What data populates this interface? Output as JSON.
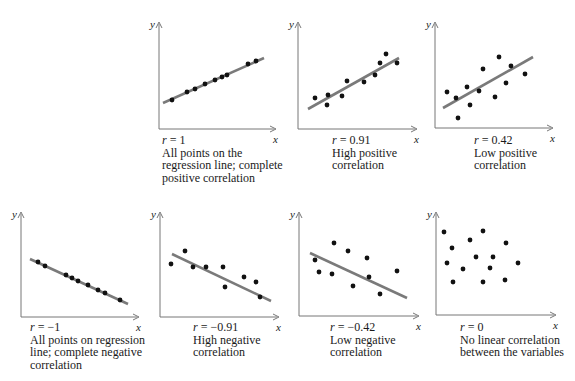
{
  "figure": {
    "style": {
      "axis_color": "#777777",
      "line_color": "#7a7a7a",
      "dot_color": "#111111",
      "text_color": "#1a1a1a"
    },
    "axis_labels": {
      "x": "x",
      "y": "y"
    }
  },
  "chart_data": [
    {
      "type": "scatter",
      "id": "p1",
      "r_label": "r = 1",
      "description": [
        "All points on the",
        "regression line; complete",
        "positive correlation"
      ],
      "axes": {
        "ox": 159,
        "oy": 129,
        "xend": 276,
        "ytop": 22
      },
      "caption_pos": {
        "x": 162,
        "y": 134
      },
      "regression_line": {
        "x1": 163,
        "y1": 103,
        "x2": 264,
        "y2": 58
      },
      "points": [
        [
          172,
          100
        ],
        [
          187,
          92
        ],
        [
          195,
          89
        ],
        [
          205,
          84
        ],
        [
          215,
          80
        ],
        [
          222,
          77
        ],
        [
          227,
          75
        ],
        [
          248,
          64
        ],
        [
          256,
          61
        ]
      ]
    },
    {
      "type": "scatter",
      "id": "p2",
      "r_label": "r = 0.91",
      "description": [
        "High positive",
        "correlation"
      ],
      "axes": {
        "ox": 298,
        "oy": 129,
        "xend": 417,
        "ytop": 22
      },
      "caption_pos": {
        "x": 332,
        "y": 134
      },
      "regression_line": {
        "x1": 308,
        "y1": 109,
        "x2": 399,
        "y2": 58
      },
      "points": [
        [
          315,
          98
        ],
        [
          328,
          95
        ],
        [
          327,
          105
        ],
        [
          342,
          96
        ],
        [
          347,
          81
        ],
        [
          364,
          82
        ],
        [
          375,
          75
        ],
        [
          380,
          63
        ],
        [
          386,
          54
        ],
        [
          397,
          63
        ]
      ]
    },
    {
      "type": "scatter",
      "id": "p3",
      "r_label": "r = 0.42",
      "description": [
        "Low positive",
        "correlation"
      ],
      "axes": {
        "ox": 435,
        "oy": 128,
        "xend": 553,
        "ytop": 22
      },
      "caption_pos": {
        "x": 474,
        "y": 134
      },
      "regression_line": {
        "x1": 443,
        "y1": 108,
        "x2": 533,
        "y2": 57
      },
      "points": [
        [
          447,
          92
        ],
        [
          456,
          98
        ],
        [
          458,
          118
        ],
        [
          467,
          87
        ],
        [
          470,
          105
        ],
        [
          479,
          91
        ],
        [
          483,
          69
        ],
        [
          495,
          97
        ],
        [
          499,
          57
        ],
        [
          506,
          83
        ],
        [
          511,
          66
        ],
        [
          525,
          74
        ]
      ]
    },
    {
      "type": "scatter",
      "id": "p4",
      "r_label": "r = −1",
      "description": [
        "All points on regression",
        "line;  complete negative",
        "correlation"
      ],
      "axes": {
        "ox": 21,
        "oy": 317,
        "xend": 139,
        "ytop": 212
      },
      "caption_pos": {
        "x": 30,
        "y": 321
      },
      "regression_line": {
        "x1": 30,
        "y1": 259,
        "x2": 128,
        "y2": 304
      },
      "points": [
        [
          38,
          262
        ],
        [
          45,
          266
        ],
        [
          66,
          275
        ],
        [
          72,
          278
        ],
        [
          78,
          281
        ],
        [
          88,
          285
        ],
        [
          98,
          290
        ],
        [
          105,
          293
        ],
        [
          120,
          300
        ]
      ]
    },
    {
      "type": "scatter",
      "id": "p5",
      "r_label": "r = −0.91",
      "description": [
        "High negative",
        "correlation"
      ],
      "axes": {
        "ox": 160,
        "oy": 317,
        "xend": 279,
        "ytop": 212
      },
      "caption_pos": {
        "x": 193,
        "y": 321
      },
      "regression_line": {
        "x1": 172,
        "y1": 254,
        "x2": 271,
        "y2": 301
      },
      "points": [
        [
          171,
          264
        ],
        [
          185,
          251
        ],
        [
          193,
          267
        ],
        [
          206,
          267
        ],
        [
          223,
          267
        ],
        [
          225,
          287
        ],
        [
          244,
          277
        ],
        [
          256,
          282
        ],
        [
          260,
          297
        ]
      ]
    },
    {
      "type": "scatter",
      "id": "p6",
      "r_label": "r = −0.42",
      "description": [
        "Low negative",
        "correlation"
      ],
      "axes": {
        "ox": 299,
        "oy": 316,
        "xend": 419,
        "ytop": 212
      },
      "caption_pos": {
        "x": 330,
        "y": 321
      },
      "regression_line": {
        "x1": 310,
        "y1": 253,
        "x2": 407,
        "y2": 298
      },
      "points": [
        [
          315,
          260
        ],
        [
          319,
          272
        ],
        [
          334,
          243
        ],
        [
          332,
          274
        ],
        [
          348,
          251
        ],
        [
          353,
          286
        ],
        [
          367,
          258
        ],
        [
          369,
          277
        ],
        [
          380,
          294
        ],
        [
          397,
          271
        ]
      ]
    },
    {
      "type": "scatter",
      "id": "p7",
      "r_label": "r = 0",
      "description": [
        "No linear correlation",
        "between the variables"
      ],
      "axes": {
        "ox": 436,
        "oy": 315,
        "xend": 556,
        "ytop": 212
      },
      "caption_pos": {
        "x": 460,
        "y": 321
      },
      "regression_line": null,
      "points": [
        [
          444,
          232
        ],
        [
          452,
          248
        ],
        [
          447,
          263
        ],
        [
          453,
          282
        ],
        [
          463,
          269
        ],
        [
          470,
          240
        ],
        [
          476,
          257
        ],
        [
          483,
          282
        ],
        [
          483,
          231
        ],
        [
          490,
          268
        ],
        [
          493,
          257
        ],
        [
          505,
          280
        ],
        [
          506,
          243
        ],
        [
          518,
          263
        ]
      ]
    }
  ]
}
